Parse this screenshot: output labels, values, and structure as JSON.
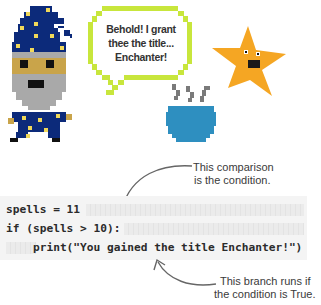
{
  "speech_bubble": {
    "lines": [
      "Behold! I grant",
      "thee the title...",
      "Enchanter!"
    ],
    "border_color": "#c8e63c"
  },
  "characters": {
    "wizard": {
      "icon": "wizard-icon",
      "hat_color": "#0c2a7a",
      "star_color": "#f0d85a",
      "face_color": "#c9a44a",
      "beard_color": "#a9a9a9"
    },
    "star": {
      "icon": "star-character-icon",
      "color": "#f5a623"
    },
    "cauldron": {
      "icon": "cauldron-icon",
      "color": "#2e8fc0",
      "steam_color": "#7a7a7a"
    }
  },
  "code": {
    "lines": [
      "spells = 11",
      "if (spells > 10):",
      "    print(\"You gained the title Enchanter!\")"
    ]
  },
  "annotations": {
    "condition": {
      "lines": [
        "This comparison",
        "is the condition."
      ]
    },
    "branch": {
      "lines": [
        "This branch runs if",
        "the condition is True."
      ]
    }
  }
}
